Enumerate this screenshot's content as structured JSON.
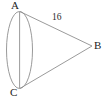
{
  "figure": {
    "name": "cone-geometry-diagram",
    "type": "geometry-figure",
    "background_color": "#ffffff",
    "stroke_color": "#8a8a8a",
    "label_color": "#1c1c1c",
    "labels": {
      "apex_top": "A",
      "apex_right": "B",
      "apex_bottom": "C",
      "slant_length": "16"
    },
    "geometry": {
      "ellipse": {
        "center_x": 19.5,
        "center_y": 50,
        "radius_x": 13,
        "radius_y": 38.5
      },
      "axis_line": {
        "x1": 19.5,
        "y1": 11.5,
        "x2": 19.5,
        "y2": 88.5
      },
      "slant_upper": {
        "x1": 20,
        "y1": 11.5,
        "x2": 92,
        "y2": 46
      },
      "slant_lower": {
        "x1": 20,
        "y1": 88.5,
        "x2": 92,
        "y2": 46
      }
    }
  }
}
